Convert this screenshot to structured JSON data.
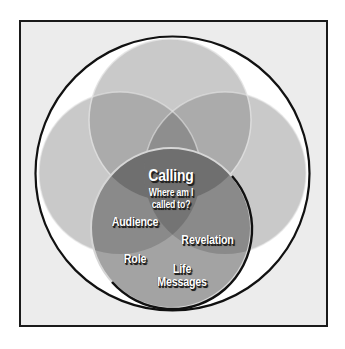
{
  "diagram": {
    "type": "venn",
    "center_title": "Calling",
    "center_subtitle_line1": "Where am I",
    "center_subtitle_line2": "called to?",
    "circle_labels": {
      "audience": "Audience",
      "revelation": "Revelation",
      "role": "Role",
      "life_line1": "Life",
      "life_line2": "Messages"
    },
    "circles": [
      {
        "name": "top",
        "cx": 170,
        "cy": 120,
        "r": 81
      },
      {
        "name": "left",
        "cx": 120,
        "cy": 173,
        "r": 81
      },
      {
        "name": "right",
        "cx": 225,
        "cy": 173,
        "r": 81
      },
      {
        "name": "bottom",
        "cx": 171,
        "cy": 228,
        "r": 80
      }
    ],
    "colors": {
      "frame_background": "#ececec",
      "outer_ring": "#ffffff",
      "circle_fill": "#c6c6c6",
      "overlap_fill": "#9c9c9c",
      "center_fill": "#707070",
      "outline": "#111111"
    }
  }
}
